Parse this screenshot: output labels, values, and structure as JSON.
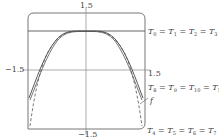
{
  "diagram": {
    "axes": {
      "y_top_label": "1.5",
      "y_bottom_label": "−1.5",
      "x_left_label": "−1.5",
      "x_right_label": "1.5"
    },
    "labels": {
      "top_family": {
        "T": "T",
        "subs": [
          "0",
          "1",
          "2",
          "3"
        ]
      },
      "middle_family": {
        "T": "T",
        "subs": [
          "8",
          "9",
          "10",
          "11"
        ]
      },
      "bottom_family": {
        "T": "T",
        "subs": [
          "4",
          "5",
          "6",
          "7"
        ]
      },
      "function_label": "f"
    },
    "colors": {
      "line": "#555555",
      "axis": "#777777"
    },
    "curves": [
      {
        "name": "f",
        "style": "solid"
      },
      {
        "name": "T8=T9=T10=T11",
        "style": "solid"
      },
      {
        "name": "T4=T5=T6=T7",
        "style": "dashed"
      },
      {
        "name": "T0=T1=T2=T3",
        "style": "solid-horizontal"
      }
    ]
  }
}
